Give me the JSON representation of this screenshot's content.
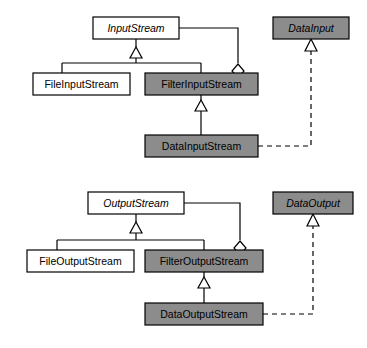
{
  "diagram": {
    "type": "uml-class-diagram",
    "colors": {
      "background": "#ffffff",
      "box_fill_concrete_light": "#ffffff",
      "box_fill_highlight": "#8c8c8c",
      "stroke": "#000000",
      "text": "#000000"
    },
    "groups": [
      {
        "name": "input-group",
        "classes": [
          {
            "id": "input-stream",
            "label": "InputStream",
            "abstract": true,
            "fill": "#ffffff",
            "x": 93,
            "y": 17,
            "w": 86,
            "h": 22
          },
          {
            "id": "file-input-stream",
            "label": "FileInputStream",
            "abstract": false,
            "fill": "#ffffff",
            "x": 33,
            "y": 73,
            "w": 97,
            "h": 22
          },
          {
            "id": "filter-input-stream",
            "label": "FilterInputStream",
            "abstract": false,
            "fill": "#8c8c8c",
            "x": 145,
            "y": 73,
            "w": 113,
            "h": 22
          },
          {
            "id": "data-input-stream",
            "label": "DataInputStream",
            "abstract": false,
            "fill": "#8c8c8c",
            "x": 145,
            "y": 135,
            "w": 113,
            "h": 22
          },
          {
            "id": "data-input",
            "label": "DataInput",
            "abstract": true,
            "fill": "#8c8c8c",
            "x": 273,
            "y": 17,
            "w": 76,
            "h": 22
          }
        ],
        "relations": [
          {
            "id": "rel-fileinput-inherits-inputstream",
            "kind": "generalization",
            "from": "FileInputStream",
            "to": "InputStream"
          },
          {
            "id": "rel-filterinput-inherits-inputstream",
            "kind": "generalization",
            "from": "FilterInputStream",
            "to": "InputStream"
          },
          {
            "id": "rel-datainput-inherits-filterinput",
            "kind": "generalization",
            "from": "DataInputStream",
            "to": "FilterInputStream"
          },
          {
            "id": "rel-filterinput-aggregates-inputstream",
            "kind": "aggregation",
            "from": "FilterInputStream",
            "to": "InputStream"
          },
          {
            "id": "rel-datainputstream-realizes-datainput",
            "kind": "realization",
            "from": "DataInputStream",
            "to": "DataInput"
          }
        ]
      },
      {
        "name": "output-group",
        "classes": [
          {
            "id": "output-stream",
            "label": "OutputStream",
            "abstract": true,
            "fill": "#ffffff",
            "x": 88,
            "y": 192,
            "w": 96,
            "h": 22
          },
          {
            "id": "file-output-stream",
            "label": "FileOutputStream",
            "abstract": false,
            "fill": "#ffffff",
            "x": 27,
            "y": 250,
            "w": 107,
            "h": 22
          },
          {
            "id": "filter-output-stream",
            "label": "FilterOutputStream",
            "abstract": false,
            "fill": "#8c8c8c",
            "x": 145,
            "y": 250,
            "w": 118,
            "h": 22
          },
          {
            "id": "data-output-stream",
            "label": "DataOutputStream",
            "abstract": false,
            "fill": "#8c8c8c",
            "x": 145,
            "y": 303,
            "w": 118,
            "h": 22
          },
          {
            "id": "data-output",
            "label": "DataOutput",
            "abstract": true,
            "fill": "#8c8c8c",
            "x": 273,
            "y": 192,
            "w": 80,
            "h": 22
          }
        ],
        "relations": [
          {
            "id": "rel-fileoutput-inherits-outputstream",
            "kind": "generalization",
            "from": "FileOutputStream",
            "to": "OutputStream"
          },
          {
            "id": "rel-filteroutput-inherits-outputstream",
            "kind": "generalization",
            "from": "FilterOutputStream",
            "to": "OutputStream"
          },
          {
            "id": "rel-dataoutput-inherits-filteroutput",
            "kind": "generalization",
            "from": "DataOutputStream",
            "to": "FilterOutputStream"
          },
          {
            "id": "rel-filteroutput-aggregates-outputstream",
            "kind": "aggregation",
            "from": "FilterOutputStream",
            "to": "OutputStream"
          },
          {
            "id": "rel-dataoutputstream-realizes-dataoutput",
            "kind": "realization",
            "from": "DataOutputStream",
            "to": "DataOutput"
          }
        ]
      }
    ]
  }
}
